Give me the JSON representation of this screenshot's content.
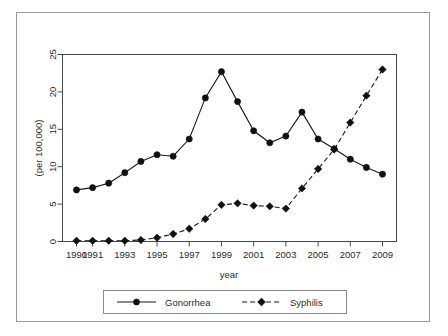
{
  "chart_data": {
    "type": "line",
    "title": "",
    "xlabel": "year",
    "ylabel": "(per 100,000)",
    "xlim": [
      1990,
      2009
    ],
    "ylim": [
      0,
      25
    ],
    "grid": false,
    "legend_position": "bottom",
    "x": [
      1990,
      1991,
      1992,
      1993,
      1994,
      1995,
      1996,
      1997,
      1998,
      1999,
      2000,
      2001,
      2002,
      2003,
      2004,
      2005,
      2006,
      2007,
      2008,
      2009
    ],
    "xtick_labels": [
      "1990",
      "1991",
      "1993",
      "1995",
      "1997",
      "1999",
      "2001",
      "2003",
      "2005",
      "2007",
      "2009"
    ],
    "xtick_values": [
      1990,
      1991,
      1993,
      1995,
      1997,
      1999,
      2001,
      2003,
      2005,
      2007,
      2009
    ],
    "ytick_labels": [
      "0",
      "5",
      "10",
      "15",
      "20",
      "25"
    ],
    "ytick_values": [
      0,
      5,
      10,
      15,
      20,
      25
    ],
    "series": [
      {
        "name": "Gonorrhea",
        "marker": "circle",
        "linestyle": "solid",
        "color": "#111111",
        "values": [
          6.9,
          7.2,
          7.8,
          9.2,
          10.7,
          11.6,
          11.4,
          13.7,
          19.2,
          22.7,
          18.7,
          14.8,
          13.2,
          14.1,
          17.3,
          13.7,
          12.4,
          11.0,
          9.9,
          9.0
        ]
      },
      {
        "name": "Syphilis",
        "marker": "diamond",
        "linestyle": "dashed",
        "color": "#111111",
        "values": [
          0.1,
          0.1,
          0.1,
          0.1,
          0.2,
          0.5,
          1.0,
          1.7,
          3.0,
          4.9,
          5.1,
          4.8,
          4.7,
          4.4,
          7.1,
          9.7,
          12.3,
          15.9,
          19.5,
          23.0
        ]
      }
    ]
  },
  "legend": {
    "entries": [
      {
        "label": "Gonorrhea"
      },
      {
        "label": "Syphilis"
      }
    ]
  },
  "axes": {
    "x_title": "year",
    "y_title": "(per 100,000)"
  }
}
